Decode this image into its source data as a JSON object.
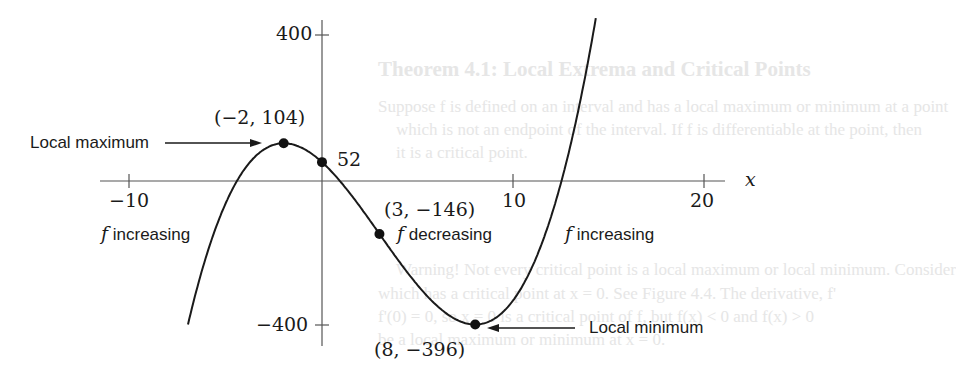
{
  "chart_data": {
    "type": "line",
    "title": "",
    "function": "f(x) = x^3 - 9x^2 - 48x + 52",
    "xlabel": "x",
    "ylabel": "",
    "xlim": [
      -10,
      20
    ],
    "ylim": [
      -400,
      400
    ],
    "x_ticks": [
      -10,
      10,
      20
    ],
    "x_tick_labels": [
      "−10",
      "10",
      "20"
    ],
    "y_ticks": [
      400,
      -400
    ],
    "y_tick_labels": [
      "400",
      "−400"
    ],
    "grid": false,
    "legend": null,
    "series": [
      {
        "name": "f",
        "x_range": [
          -7,
          14.3
        ],
        "coefficients": [
          1,
          -9,
          -48,
          52
        ]
      }
    ],
    "points": [
      {
        "x": -2,
        "y": 104,
        "label": "(−2, 104)",
        "annotation": "Local maximum"
      },
      {
        "x": 0,
        "y": 52,
        "label": "52",
        "annotation": ""
      },
      {
        "x": 3,
        "y": -146,
        "label": "(3, −146)",
        "annotation": ""
      },
      {
        "x": 8,
        "y": -396,
        "label": "(8, −396)",
        "annotation": "Local minimum"
      }
    ],
    "region_labels": [
      {
        "f": "f",
        "text": "increasing"
      },
      {
        "f": "f",
        "text": "decreasing"
      },
      {
        "f": "f",
        "text": "increasing"
      }
    ],
    "annotations": [
      "Local maximum",
      "Local minimum"
    ]
  },
  "labels": {
    "y400": "400",
    "yneg400": "−400",
    "xneg10": "−10",
    "x10": "10",
    "x20": "20",
    "xaxis": "x",
    "pt_max": "(−2, 104)",
    "pt_yint": "52",
    "pt_inflect": "(3, −146)",
    "pt_min": "(8, −396)",
    "local_max": "Local maximum",
    "local_min": "Local minimum",
    "f1": "f",
    "inc1": " increasing",
    "f2": "f",
    "dec": " decreasing",
    "f3": "f",
    "inc2": " increasing"
  },
  "background_bleed": {
    "heading": "Theorem 4.1: Local Extrema and Critical Points",
    "line1": "Suppose f is defined on an interval and has a local maximum or minimum at a point",
    "line2": "which is not an endpoint of the interval. If f is differentiable at the point, then",
    "line3": "it is a critical point.",
    "line4": "Warning! Not every critical point is a local maximum or local minimum. Consider",
    "line5": "which has a critical point at x = 0. See Figure 4.4. The derivative, f'",
    "line6": "f'(0) = 0, so x = 0 is a critical point of f, but f(x) < 0 and f(x) > 0",
    "line7": "be a local maximum or minimum at x = 0."
  },
  "mapping": {
    "x0": 322,
    "y0": 181,
    "sx": 19.15,
    "sy": 0.3625
  }
}
